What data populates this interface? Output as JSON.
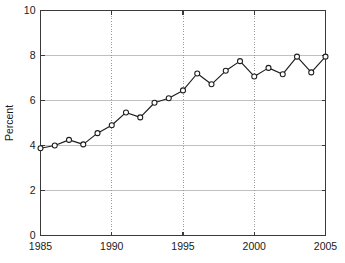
{
  "chart_data": {
    "type": "line",
    "title": "",
    "xlabel": "",
    "ylabel": "Percent",
    "xlim": [
      1985,
      2005
    ],
    "ylim": [
      0,
      10
    ],
    "xticks": [
      1985,
      1990,
      1995,
      2000,
      2005
    ],
    "xtick_labels": [
      "1985",
      "1990",
      "1995",
      "2000",
      "2005"
    ],
    "yticks": [
      0,
      2,
      4,
      6,
      8,
      10
    ],
    "ytick_labels": [
      "0",
      "2",
      "4",
      "6",
      "8",
      "10"
    ],
    "grid": true,
    "grid_axes": "both",
    "legend": null,
    "marker": "open-circle",
    "line_color": "#1c1c1c",
    "marker_face_color": "#ffffff",
    "grid_color": "#b9b9b9",
    "axis_color": "#3a3a3a",
    "background_color": "#ffffff",
    "x": [
      1985,
      1986,
      1987,
      1988,
      1989,
      1990,
      1991,
      1992,
      1993,
      1994,
      1995,
      1996,
      1997,
      1998,
      1999,
      2000,
      2001,
      2002,
      2003,
      2004,
      2005
    ],
    "values": [
      3.88,
      4.0,
      4.25,
      4.05,
      4.55,
      4.9,
      5.47,
      5.25,
      5.9,
      6.1,
      6.45,
      7.2,
      6.72,
      7.32,
      7.75,
      7.07,
      7.45,
      7.17,
      7.95,
      7.25,
      7.95
    ],
    "series": [
      {
        "name": "Percent",
        "values": [
          3.88,
          4.0,
          4.25,
          4.05,
          4.55,
          4.9,
          5.47,
          5.25,
          5.9,
          6.1,
          6.45,
          7.2,
          6.72,
          7.32,
          7.75,
          7.07,
          7.45,
          7.17,
          7.95,
          7.25,
          7.95
        ]
      }
    ]
  }
}
